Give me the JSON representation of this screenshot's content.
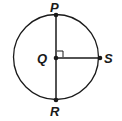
{
  "diagram": {
    "type": "circle-geometry",
    "circle": {
      "cx": 56,
      "cy": 57,
      "r": 42,
      "stroke": "#1a1a1a"
    },
    "points": [
      {
        "name": "P",
        "x": 56,
        "y": 15,
        "label_x": 50,
        "label_y": 11
      },
      {
        "name": "Q",
        "x": 56,
        "y": 58,
        "label_x": 37,
        "label_y": 62
      },
      {
        "name": "S",
        "x": 100,
        "y": 58,
        "label_x": 104,
        "label_y": 62
      },
      {
        "name": "R",
        "x": 56,
        "y": 100,
        "label_x": 50,
        "label_y": 115
      }
    ],
    "segments": [
      {
        "from": "P",
        "to": "R",
        "name": "diameter-PR"
      },
      {
        "from": "Q",
        "to": "S",
        "name": "radius-QS"
      }
    ],
    "right_angle_at": "Q",
    "labels": {
      "P": "P",
      "Q": "Q",
      "R": "R",
      "S": "S"
    }
  }
}
